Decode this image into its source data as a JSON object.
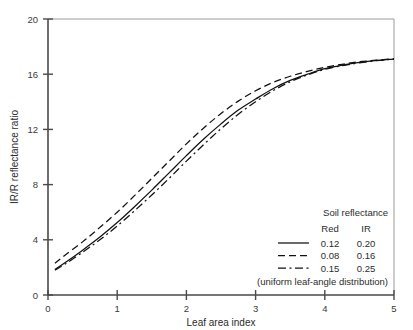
{
  "chart_data": {
    "type": "line",
    "title": "",
    "xlabel": "Leaf area index",
    "ylabel": "IR/R reflectance ratio",
    "xlim": [
      0,
      5
    ],
    "ylim": [
      0,
      20
    ],
    "xticks": [
      "0",
      "1",
      "2",
      "3",
      "4",
      "5"
    ],
    "yticks": [
      "0",
      "4",
      "8",
      "12",
      "16",
      "20"
    ],
    "grid": false,
    "legend_position": "lower-right",
    "x": [
      0.1,
      0.25,
      0.5,
      0.75,
      1.0,
      1.25,
      1.5,
      1.75,
      2.0,
      2.25,
      2.5,
      2.75,
      3.0,
      3.25,
      3.5,
      3.75,
      4.0,
      4.25,
      4.5,
      4.75,
      5.0
    ],
    "series": [
      {
        "name": "0.12 0.20",
        "red": "0.12",
        "ir": "0.20",
        "style": "solid",
        "values": [
          1.85,
          2.35,
          3.25,
          4.2,
          5.25,
          6.4,
          7.6,
          8.85,
          10.1,
          11.3,
          12.4,
          13.4,
          14.2,
          14.95,
          15.55,
          16.0,
          16.4,
          16.65,
          16.85,
          17.0,
          17.1
        ]
      },
      {
        "name": "0.08 0.16",
        "red": "0.08",
        "ir": "0.16",
        "style": "dashed",
        "values": [
          2.3,
          2.9,
          3.85,
          4.9,
          6.0,
          7.2,
          8.45,
          9.7,
          10.95,
          12.1,
          13.15,
          14.05,
          14.8,
          15.4,
          15.85,
          16.2,
          16.5,
          16.72,
          16.9,
          17.02,
          17.12
        ]
      },
      {
        "name": "0.15 0.25",
        "red": "0.15",
        "ir": "0.25",
        "style": "dash-dot",
        "values": [
          1.8,
          2.25,
          3.1,
          4.0,
          5.0,
          6.1,
          7.25,
          8.45,
          9.7,
          10.9,
          12.05,
          13.1,
          14.0,
          14.8,
          15.45,
          15.95,
          16.35,
          16.62,
          16.82,
          16.98,
          17.1
        ]
      }
    ],
    "legend": {
      "title": "Soil reflectance",
      "column_headers": [
        "Red",
        "IR"
      ],
      "rows": [
        {
          "style": "solid",
          "red": "0.12",
          "ir": "0.20"
        },
        {
          "style": "dashed",
          "red": "0.08",
          "ir": "0.16"
        },
        {
          "style": "dash-dot",
          "red": "0.15",
          "ir": "0.25"
        }
      ],
      "footnote": "(uniform leaf-angle distribution)"
    },
    "colors": {
      "curve": "#111111",
      "axis": "#4a4a4a",
      "frame": "#9a9a9a",
      "background": "#ffffff",
      "text": "#2b2b2b"
    }
  }
}
